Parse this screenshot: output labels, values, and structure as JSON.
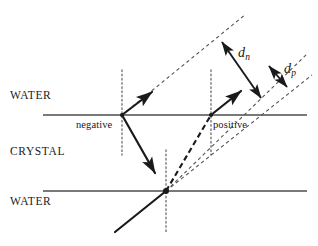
{
  "figure": {
    "background_color": "#ffffff",
    "stroke_color": "#1a1a1a",
    "interface_color": "#4d4d4d",
    "guide_color": "#555555",
    "width": 318,
    "height": 246
  },
  "media_labels": [
    {
      "name": "water-top",
      "text": "WATER",
      "x": 10,
      "y": 90
    },
    {
      "name": "crystal",
      "text": "CRYSTAL",
      "x": 10,
      "y": 146
    },
    {
      "name": "water-bottom",
      "text": "WATER",
      "x": 10,
      "y": 196
    }
  ],
  "charge_labels": [
    {
      "name": "negative",
      "text": "negative",
      "x": 76,
      "y": 120
    },
    {
      "name": "positive",
      "text": "positive",
      "x": 213,
      "y": 120
    }
  ],
  "distance_labels": [
    {
      "name": "d-n",
      "symbol": "d",
      "subscript": "n",
      "x": 238,
      "y": 46
    },
    {
      "name": "d-p",
      "symbol": "d",
      "subscript": "p",
      "x": 284,
      "y": 62
    }
  ],
  "interfaces": [
    {
      "name": "water-crystal-interface",
      "x1": 43,
      "y1": 115,
      "x2": 307,
      "y2": 115
    },
    {
      "name": "crystal-water-interface",
      "x1": 43,
      "y1": 191,
      "x2": 307,
      "y2": 191
    }
  ],
  "normals": [
    {
      "name": "normal-negative",
      "x1": 122,
      "y1": 70,
      "x2": 122,
      "y2": 155
    },
    {
      "name": "normal-positive",
      "x1": 211,
      "y1": 70,
      "x2": 211,
      "y2": 155
    },
    {
      "name": "normal-entry",
      "x1": 166,
      "y1": 150,
      "x2": 166,
      "y2": 232
    }
  ],
  "rays": [
    {
      "name": "incident-ray",
      "x1": 115,
      "y1": 232,
      "x2": 166,
      "y2": 191,
      "style": "solid",
      "arrow": "none"
    },
    {
      "name": "negative-ray-in-crystal",
      "x1": 122,
      "y1": 115,
      "x2": 158,
      "y2": 178,
      "style": "solid",
      "arrow": "end"
    },
    {
      "name": "negative-ray-in-water",
      "x1": 122,
      "y1": 115,
      "x2": 155,
      "y2": 89,
      "style": "solid",
      "arrow": "end"
    },
    {
      "name": "positive-ray-in-crystal",
      "x1": 166,
      "y1": 191,
      "x2": 211,
      "y2": 115,
      "style": "dashed",
      "arrow": "none"
    },
    {
      "name": "positive-ray-in-water",
      "x1": 211,
      "y1": 115,
      "x2": 244,
      "y2": 88,
      "style": "solid",
      "arrow": "end"
    }
  ],
  "guide_lines": [
    {
      "name": "negative-extension-upper",
      "x1": 122,
      "y1": 115,
      "x2": 246,
      "y2": 14
    },
    {
      "name": "positive-extension-upper",
      "x1": 166,
      "y1": 191,
      "x2": 308,
      "y2": 53
    },
    {
      "name": "reference-extension-lower",
      "x1": 166,
      "y1": 191,
      "x2": 312,
      "y2": 75
    }
  ],
  "measure_arrows": [
    {
      "name": "d-n-measure",
      "x1": 218,
      "y1": 37,
      "x2": 265,
      "y2": 103,
      "arrow": "both"
    },
    {
      "name": "d-p-measure",
      "x1": 266,
      "y1": 62,
      "x2": 290,
      "y2": 91,
      "arrow": "both"
    }
  ],
  "vertex_points": [
    {
      "name": "negative-exit-point",
      "x": 122,
      "y": 115
    },
    {
      "name": "positive-exit-point",
      "x": 211,
      "y": 115
    },
    {
      "name": "entry-point",
      "x": 166,
      "y": 191
    }
  ]
}
